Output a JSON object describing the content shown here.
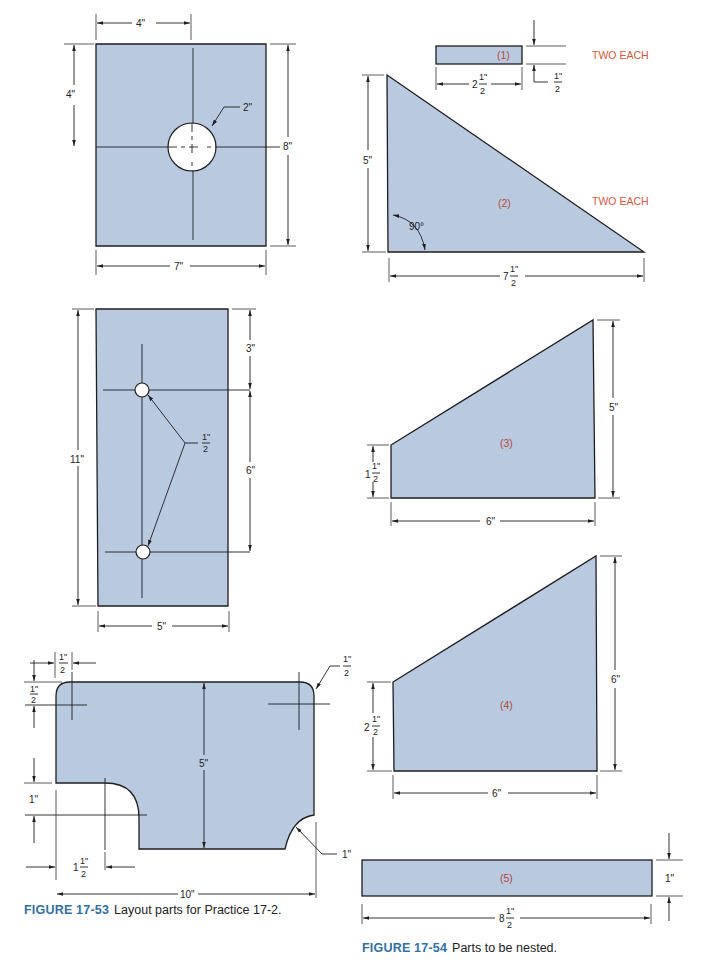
{
  "colors": {
    "part_fill": "#b9c9e0",
    "label_red": "#b04a38",
    "note_orange": "#d3573a",
    "caption_blue": "#2f6fa6"
  },
  "figure_53": {
    "label": "FIGURE 17-53",
    "caption": "Layout parts for Practice 17-2.",
    "part_a": {
      "width": "7\"",
      "height": "8\"",
      "hole_offset_x": "4\"",
      "hole_offset_y": "4\"",
      "hole_diameter": "2\""
    },
    "part_b": {
      "width": "5\"",
      "height": "11\"",
      "top_offset": "3\"",
      "hole_spacing": "6\"",
      "hole_diameter_whole": "",
      "hole_diameter_num": "1\"",
      "hole_diameter_den": "2"
    },
    "part_c": {
      "width": "10\"",
      "height": "5\"",
      "corner_x_num": "1\"",
      "corner_x_den": "2",
      "corner_y_num": "1\"",
      "corner_y_den": "2",
      "corner_radius_num": "1\"",
      "corner_radius_den": "2",
      "notch_depth": "1\"",
      "notch_x_whole": "1",
      "notch_x_num": "1\"",
      "notch_x_den": "2",
      "notch_radius": "1\""
    }
  },
  "figure_54": {
    "label": "FIGURE 17-54",
    "caption": "Parts to be nested.",
    "part_1": {
      "label": "(1)",
      "quantity": "TWO EACH",
      "width_whole": "2",
      "width_num": "1\"",
      "width_den": "2",
      "height_num": "1\"",
      "height_den": "2"
    },
    "part_2": {
      "label": "(2)",
      "quantity": "TWO EACH",
      "height": "5\"",
      "angle": "90°",
      "width_whole": "7",
      "width_num": "1\"",
      "width_den": "2"
    },
    "part_3": {
      "label": "(3)",
      "left_height_whole": "1",
      "left_height_num": "1\"",
      "left_height_den": "2",
      "right_height": "5\"",
      "width": "6\""
    },
    "part_4": {
      "label": "(4)",
      "left_height_whole": "2",
      "left_height_num": "1\"",
      "left_height_den": "2",
      "right_height": "6\"",
      "width": "6\""
    },
    "part_5": {
      "label": "(5)",
      "height": "1\"",
      "width_whole": "8",
      "width_num": "1\"",
      "width_den": "2"
    }
  }
}
